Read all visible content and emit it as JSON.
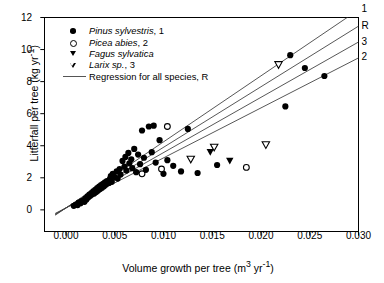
{
  "chart_data": {
    "type": "scatter",
    "title": "",
    "xlabel": "Volume growth per tree (m3 yr-1)",
    "ylabel": "Litterfall per tree (kg yr-1)",
    "xlabel_parts": {
      "pre": "Volume growth per tree (m",
      "sup1": "3",
      "mid": " yr",
      "sup2": "-1",
      "post": ")"
    },
    "ylabel_parts": {
      "pre": "Litterfall per tree (kg yr",
      "sup": "-1",
      "post": ")"
    },
    "xlim": [
      -0.0022,
      0.03
    ],
    "ylim": [
      -1.35,
      12
    ],
    "xticks": [
      0.0,
      0.005,
      0.01,
      0.015,
      0.02,
      0.025,
      0.03
    ],
    "xticklabels": [
      "0.000",
      "0.005",
      "0.010",
      "0.015",
      "0.020",
      "0.025",
      "0.030"
    ],
    "yticks": [
      0,
      2,
      4,
      6,
      8,
      10,
      12
    ],
    "yticklabels": [
      "0",
      "2",
      "4",
      "6",
      "8",
      "10",
      "12"
    ],
    "grid": false,
    "tick_direction": "out",
    "frame": "box",
    "legend_position": "upper left",
    "series": [
      {
        "name": "Pinus sylvestris, 1",
        "label_italic": "Pinus sylvestris",
        "label_rest": ", 1",
        "marker": "filled-circle",
        "color": "#000000",
        "points": [
          [
            0.0008,
            0.25
          ],
          [
            0.001,
            0.32
          ],
          [
            0.0012,
            0.3
          ],
          [
            0.0013,
            0.45
          ],
          [
            0.0015,
            0.42
          ],
          [
            0.0016,
            0.55
          ],
          [
            0.0018,
            0.6
          ],
          [
            0.0019,
            0.5
          ],
          [
            0.002,
            0.72
          ],
          [
            0.0021,
            0.65
          ],
          [
            0.0022,
            0.85
          ],
          [
            0.0023,
            0.78
          ],
          [
            0.0024,
            0.95
          ],
          [
            0.0025,
            0.88
          ],
          [
            0.0026,
            1.05
          ],
          [
            0.0027,
            0.98
          ],
          [
            0.0028,
            1.15
          ],
          [
            0.0029,
            1.02
          ],
          [
            0.003,
            1.25
          ],
          [
            0.0031,
            1.12
          ],
          [
            0.0032,
            1.35
          ],
          [
            0.0033,
            1.2
          ],
          [
            0.0034,
            1.45
          ],
          [
            0.0035,
            1.3
          ],
          [
            0.0036,
            1.55
          ],
          [
            0.0037,
            1.38
          ],
          [
            0.0038,
            1.62
          ],
          [
            0.0039,
            1.48
          ],
          [
            0.004,
            1.72
          ],
          [
            0.0041,
            1.58
          ],
          [
            0.0042,
            1.8
          ],
          [
            0.0044,
            1.68
          ],
          [
            0.0045,
            1.92
          ],
          [
            0.0046,
            2.1
          ],
          [
            0.0047,
            1.75
          ],
          [
            0.0048,
            2.25
          ],
          [
            0.005,
            2.05
          ],
          [
            0.0052,
            2.4
          ],
          [
            0.0053,
            1.95
          ],
          [
            0.0055,
            2.55
          ],
          [
            0.0056,
            2.2
          ],
          [
            0.0058,
            3.05
          ],
          [
            0.006,
            2.7
          ],
          [
            0.0061,
            3.3
          ],
          [
            0.0062,
            2.45
          ],
          [
            0.0064,
            3.55
          ],
          [
            0.0065,
            2.9
          ],
          [
            0.0067,
            3.15
          ],
          [
            0.0068,
            2.6
          ],
          [
            0.007,
            3.8
          ],
          [
            0.0072,
            2.35
          ],
          [
            0.0074,
            3.45
          ],
          [
            0.0076,
            2.85
          ],
          [
            0.0078,
            4.95
          ],
          [
            0.008,
            3.25
          ],
          [
            0.0082,
            2.5
          ],
          [
            0.0085,
            5.2
          ],
          [
            0.0088,
            3.6
          ],
          [
            0.0092,
            2.95
          ],
          [
            0.0096,
            4.35
          ],
          [
            0.01,
            2.25
          ],
          [
            0.0104,
            3.1
          ],
          [
            0.011,
            2.75
          ],
          [
            0.0118,
            2.4
          ],
          [
            0.0125,
            5.05
          ],
          [
            0.0135,
            2.3
          ],
          [
            0.0155,
            2.8
          ],
          [
            0.023,
            9.65
          ],
          [
            0.0245,
            8.85
          ],
          [
            0.0265,
            8.35
          ],
          [
            0.0225,
            6.45
          ],
          [
            0.009,
            5.25
          ]
        ]
      },
      {
        "name": "Picea abies, 2",
        "label_italic": "Picea abies",
        "label_rest": ", 2",
        "marker": "open-circle",
        "color": "#000000",
        "points": [
          [
            0.0104,
            5.2
          ],
          [
            0.0098,
            2.55
          ],
          [
            0.0078,
            2.25
          ],
          [
            0.0185,
            2.65
          ]
        ]
      },
      {
        "name": "Fagus sylvatica",
        "label_italic": "Fagus sylvatica",
        "label_rest": "",
        "marker": "filled-triangle-down",
        "color": "#000000",
        "points": [
          [
            0.0148,
            3.6
          ],
          [
            0.0168,
            3.05
          ]
        ]
      },
      {
        "name": "Larix sp., 3",
        "label_italic": "Larix sp.",
        "label_rest": ", 3",
        "marker": "open-triangle-down",
        "color": "#000000",
        "points": [
          [
            0.0128,
            3.15
          ],
          [
            0.0152,
            3.9
          ],
          [
            0.0205,
            4.05
          ],
          [
            0.0218,
            9.05
          ]
        ]
      }
    ],
    "regression_lines": [
      {
        "label": "1",
        "intercept": 0.12,
        "slope": 412,
        "x0": -0.0011,
        "x1": 0.03
      },
      {
        "label": "R",
        "intercept": 0.12,
        "slope": 378,
        "x0": -0.0011,
        "x1": 0.03
      },
      {
        "label": "3",
        "intercept": 0.12,
        "slope": 345,
        "x0": -0.0011,
        "x1": 0.03
      },
      {
        "label": "2",
        "intercept": 0.12,
        "slope": 312,
        "x0": -0.0011,
        "x1": 0.03
      }
    ],
    "regression_legend": "Regression for all species, R",
    "line_color": "#444444"
  }
}
